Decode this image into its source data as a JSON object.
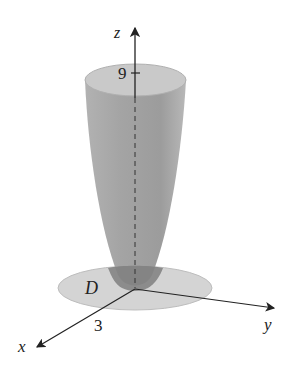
{
  "figure": {
    "type": "3d-surface-diagram",
    "surface": "paraboloid",
    "axes": {
      "z_label": "z",
      "y_label": "y",
      "x_label": "x"
    },
    "ticks": {
      "z_tick": "9",
      "x_tick": "3"
    },
    "region_label": "D",
    "colors": {
      "surface": "#9a9a9a",
      "rim_top": "#c8c8c8",
      "disk": "#d6d6d6",
      "disk_overlap": "#7d7d7d",
      "axis": "#222222"
    }
  }
}
